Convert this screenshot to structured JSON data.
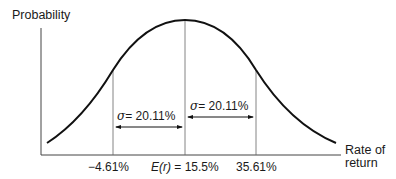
{
  "diagram": {
    "type": "normal-distribution",
    "y_axis_label": "Probability",
    "x_axis_label_line1": "Rate of",
    "x_axis_label_line2": "return",
    "ticks": {
      "left": "−4.61%",
      "center_prefix": "E(r)",
      "center_value": "= 15.5%",
      "right": "35.61%"
    },
    "sigma_left": {
      "symbol": "σ",
      "value": "= 20.11%"
    },
    "sigma_right": {
      "symbol": "σ",
      "value": "= 20.11%"
    },
    "colors": {
      "line": "#1a1a1a",
      "axis": "#555555"
    }
  }
}
